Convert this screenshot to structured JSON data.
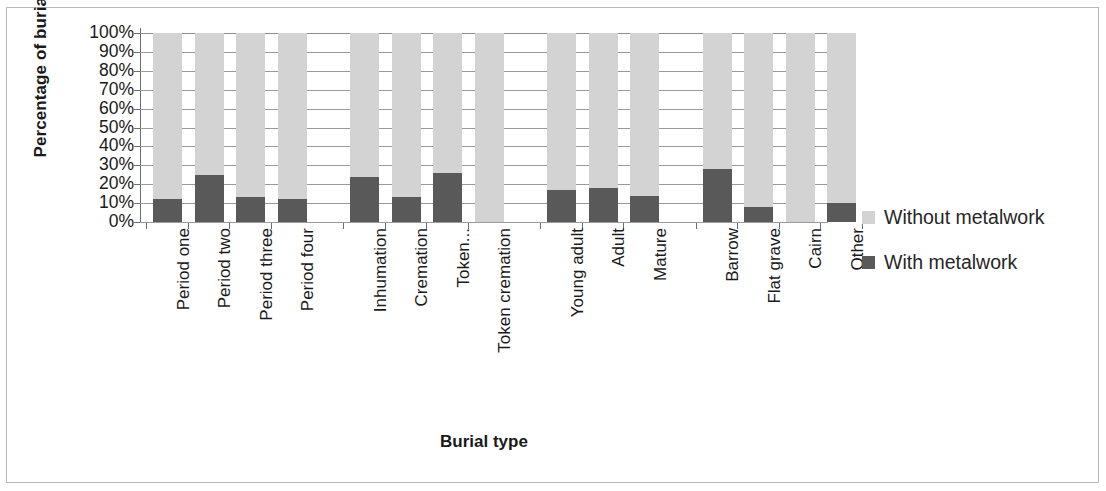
{
  "chart_data": {
    "type": "bar",
    "subtype": "stacked-percentage",
    "title": "",
    "xlabel": "Burial type",
    "ylabel": "Percentage of burials",
    "ylim": [
      0,
      100
    ],
    "ytick_labels": [
      "100%",
      "90%",
      "80%",
      "70%",
      "60%",
      "50%",
      "40%",
      "30%",
      "20%",
      "10%",
      "0%"
    ],
    "ytick_values": [
      100,
      90,
      80,
      70,
      60,
      50,
      40,
      30,
      20,
      10,
      0
    ],
    "grid": true,
    "legend_position": "right",
    "categories": [
      "Period one",
      "Period two",
      "Period three",
      "Period four",
      "Inhumation",
      "Cremation",
      "Token...",
      "Token cremation",
      "Young adult",
      "Adult",
      "Mature",
      "Barrow",
      "Flat grave",
      "Cairn",
      "Other"
    ],
    "group_breaks": [
      4,
      8,
      11
    ],
    "series": [
      {
        "name": "With metalwork",
        "color": "#595959",
        "values": [
          12,
          25,
          13,
          12,
          24,
          13,
          26,
          0,
          17,
          18,
          14,
          28,
          8,
          0,
          10
        ]
      },
      {
        "name": "Without metalwork",
        "color": "#d3d3d3",
        "values": [
          88,
          75,
          87,
          88,
          76,
          87,
          74,
          100,
          83,
          82,
          86,
          72,
          92,
          100,
          90
        ]
      }
    ],
    "legend": [
      {
        "label": "Without metalwork",
        "color": "#d3d3d3"
      },
      {
        "label": "With metalwork",
        "color": "#595959"
      }
    ]
  },
  "colors": {
    "with_metalwork": "#595959",
    "without_metalwork": "#d3d3d3",
    "gridline": "#9a9a9a",
    "axis": "#6d6d6d",
    "text": "#1a1a1a",
    "frame": "#b9b9b9"
  }
}
